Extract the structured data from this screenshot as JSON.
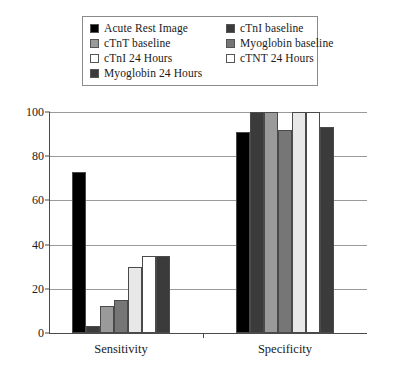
{
  "chart_data": {
    "type": "bar",
    "title": "",
    "xlabel": "",
    "ylabel": "",
    "ylim": [
      0,
      100
    ],
    "yticks": [
      0,
      20,
      40,
      60,
      80,
      100
    ],
    "grid": true,
    "legend_position": "top",
    "categories": [
      "Sensitivity",
      "Specificity"
    ],
    "series": [
      {
        "name": "Acute Rest Image",
        "color": "#000000",
        "values": [
          73,
          91
        ]
      },
      {
        "name": "cTnI baseline",
        "color": "#3b3b3b",
        "values": [
          3,
          100
        ]
      },
      {
        "name": "cTnT baseline",
        "color": "#9a9a9a",
        "values": [
          12,
          100
        ]
      },
      {
        "name": "Myoglobin baseline",
        "color": "#767676",
        "values": [
          15,
          92
        ]
      },
      {
        "name": "cTnI 24 Hours",
        "color": "#e8e8e8",
        "values": [
          30,
          100
        ]
      },
      {
        "name": "cTNT 24 Hours",
        "color": "#ffffff",
        "values": [
          35,
          100
        ]
      },
      {
        "name": "Myoglobin 24 Hours",
        "color": "#3b3b3b",
        "values": [
          35,
          93
        ]
      }
    ]
  },
  "legend": {
    "entries": [
      {
        "label": "Acute Rest Image",
        "color": "#000000"
      },
      {
        "label": "cTnI baseline",
        "color": "#3b3b3b"
      },
      {
        "label": "cTnT baseline",
        "color": "#9a9a9a"
      },
      {
        "label": "Myoglobin baseline",
        "color": "#767676"
      },
      {
        "label": "cTnI 24 Hours",
        "color": "#ffffff"
      },
      {
        "label": "cTNT 24 Hours",
        "color": "#ffffff"
      },
      {
        "label": "Myoglobin 24 Hours",
        "color": "#3b3b3b"
      }
    ]
  },
  "axis": {
    "y_tick_labels": [
      "100",
      "80",
      "60",
      "40",
      "20",
      "0"
    ],
    "x_tick_labels": [
      "Sensitivity",
      "Specificity"
    ]
  }
}
